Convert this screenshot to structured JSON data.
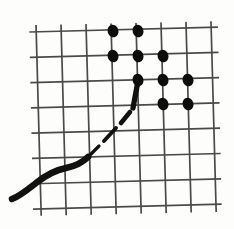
{
  "figure": {
    "background_color": "#fdfdfc",
    "grid": {
      "line_color": "#4a4a4a",
      "line_width": 1.7,
      "columns": 8,
      "rows": 8,
      "origin_x": 38,
      "origin_y": 30,
      "spacing_x": 25,
      "spacing_y": 25.3,
      "tilt_degrees": -1.2,
      "overshoot": 6,
      "x_positions": [
        38,
        63,
        88,
        113,
        138,
        163,
        188,
        213
      ],
      "y_positions": [
        30,
        55.3,
        80.6,
        105.9,
        131.2,
        156.5,
        181.8,
        207.1
      ]
    },
    "curve": {
      "color": "#111111",
      "solid_label": "solid swooping tail",
      "dashed_label": "dashed rising segment",
      "stroke_width_min": 3.2,
      "stroke_width_max": 6.5,
      "solid_path": "M 12,199 C 20,196 27,190 36,183 C 46,175 56,170 66,168 C 76,166 82,163 88,157",
      "dashed_segments": [
        "M 88,157 L 99,146",
        "M 104,141 L 116,128",
        "M 121,123 L 130,112",
        "M 133,108 L 138,81"
      ]
    },
    "dots": {
      "color": "#0d0d0d",
      "radius_x": 5.4,
      "radius_y": 6.4,
      "rotation_degrees": -18,
      "count": 10,
      "points": [
        {
          "label": "dot-r1-c1",
          "x": 113,
          "y": 31,
          "grid_col": 4,
          "grid_row": 1
        },
        {
          "label": "dot-r1-c2",
          "x": 138,
          "y": 31,
          "grid_col": 5,
          "grid_row": 1
        },
        {
          "label": "dot-r2-c1",
          "x": 113,
          "y": 56,
          "grid_col": 4,
          "grid_row": 2
        },
        {
          "label": "dot-r2-c2",
          "x": 138,
          "y": 56,
          "grid_col": 5,
          "grid_row": 2
        },
        {
          "label": "dot-r2-c3",
          "x": 163,
          "y": 56,
          "grid_col": 6,
          "grid_row": 2
        },
        {
          "label": "dot-r3-c1",
          "x": 138,
          "y": 80,
          "grid_col": 5,
          "grid_row": 3
        },
        {
          "label": "dot-r3-c2",
          "x": 163,
          "y": 80,
          "grid_col": 6,
          "grid_row": 3
        },
        {
          "label": "dot-r3-c3",
          "x": 188,
          "y": 80,
          "grid_col": 7,
          "grid_row": 3
        },
        {
          "label": "dot-r4-c1",
          "x": 163,
          "y": 104,
          "grid_col": 6,
          "grid_row": 4
        },
        {
          "label": "dot-r4-c2",
          "x": 188,
          "y": 104,
          "grid_col": 7,
          "grid_row": 4
        }
      ]
    }
  }
}
